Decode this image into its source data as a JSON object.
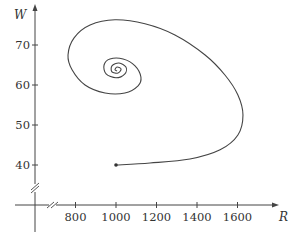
{
  "chart_data": {
    "type": "line",
    "title": "",
    "xlabel": "R",
    "ylabel": "W",
    "xlim": [
      680,
      1800
    ],
    "ylim": [
      30,
      78
    ],
    "grid": false,
    "legend": null,
    "axis_breaks": {
      "x": true,
      "y": true
    },
    "x_ticks": [
      800,
      1000,
      1200,
      1400,
      1600
    ],
    "x_tick_labels": [
      "800",
      "1000",
      "1200",
      "1400",
      "1600"
    ],
    "y_ticks": [
      40,
      50,
      60,
      70
    ],
    "y_tick_labels": [
      "40",
      "50",
      "60",
      "70"
    ],
    "annotations": [
      {
        "type": "point",
        "R": 1000,
        "W": 40,
        "marker": "filled-dot",
        "meaning": "initial point"
      }
    ],
    "series": [
      {
        "name": "phase trajectory",
        "color": "#444444",
        "R": [
          1000,
          1168,
          1365,
          1514,
          1602,
          1627,
          1602,
          1538,
          1440,
          1291,
          1143,
          995,
          872,
          793,
          763,
          783,
          847,
          946,
          1044,
          1109,
          1123,
          1094,
          1035,
          970,
          941,
          951,
          1000,
          1044,
          1049,
          1015,
          980,
          980,
          1010,
          1025,
          1005,
          995,
          1005
        ],
        "W": [
          40.0,
          40.5,
          41.5,
          43.8,
          47.5,
          52.5,
          57.5,
          62.5,
          67.5,
          72.5,
          75.3,
          76.3,
          75.0,
          71.8,
          67.5,
          63.8,
          60.0,
          58.0,
          58.0,
          59.8,
          62.0,
          64.8,
          66.5,
          66.5,
          65.0,
          62.8,
          61.8,
          62.8,
          64.5,
          65.5,
          64.8,
          63.3,
          63.0,
          64.0,
          64.5,
          63.8,
          63.5
        ]
      }
    ]
  },
  "colors": {
    "axis": "#444444",
    "curve": "#555555",
    "text": "#333333",
    "background": "#ffffff"
  }
}
